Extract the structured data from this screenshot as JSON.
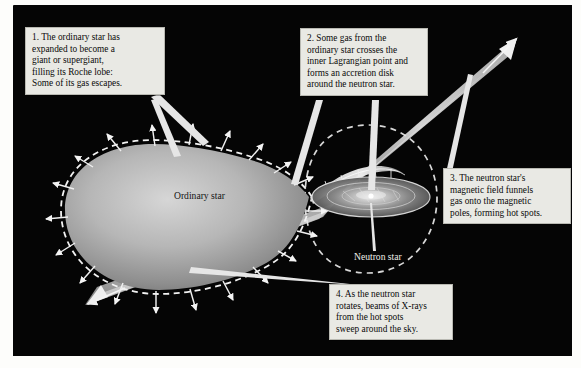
{
  "figure": {
    "type": "astronomy-diagram",
    "background_color": "#050505",
    "paper_color": "#fdfdfb",
    "callout_bg": "#e9e9e4",
    "star_color": "#b9b9b9",
    "accent_color": "#ffffff"
  },
  "callouts": [
    {
      "id": "1",
      "lines": [
        "1. The ordinary star has",
        "expanded to become a",
        "giant or supergiant,",
        "filling its Roche lobe:",
        "Some of its gas escapes."
      ]
    },
    {
      "id": "2",
      "lines": [
        "2. Some gas from the",
        "ordinary star crosses the",
        "inner Lagrangian point and",
        "forms an accretion disk",
        "around the neutron star."
      ]
    },
    {
      "id": "3",
      "lines": [
        "3. The neutron star's",
        "magnetic field funnels",
        "gas onto the magnetic",
        "poles, forming hot spots."
      ]
    },
    {
      "id": "4",
      "lines": [
        "4. As the neutron star",
        "rotates, beams of X-rays",
        "from the hot spots",
        "sweep around the sky."
      ]
    }
  ],
  "labels": {
    "ordinary_star": "Ordinary star",
    "neutron_star": "Neutron star"
  }
}
